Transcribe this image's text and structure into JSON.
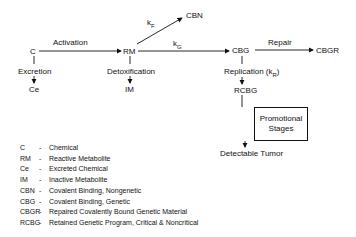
{
  "nodes": {
    "c": "C",
    "rm": "RM",
    "ce": "Ce",
    "im": "IM",
    "cbn": "CBN",
    "cbg": "CBG",
    "cbgr": "CBGR",
    "rcbg": "RCBG",
    "tumor": "Detectable Tumor",
    "promo_line1": "Promotional",
    "promo_line2": "Stages"
  },
  "edges": {
    "activation": "Activation",
    "excretion": "Excretion",
    "detoxification": "Detoxification",
    "repair": "Repair",
    "replication": "Replication (k",
    "replication_sub": "R",
    "replication_end": ")",
    "kf": "k",
    "kf_sub": "F",
    "kg": "k",
    "kg_sub": "G"
  },
  "legend": [
    {
      "abbr": "C",
      "desc": "Chemical"
    },
    {
      "abbr": "RM",
      "desc": "Reactive Metabolite"
    },
    {
      "abbr": "Ce",
      "desc": "Excreted Chemical"
    },
    {
      "abbr": "IM",
      "desc": "Inactive Metabolite"
    },
    {
      "abbr": "CBN",
      "desc": "Covalent Binding, Nongenetic"
    },
    {
      "abbr": "CBG",
      "desc": "Covalent Binding, Genetic"
    },
    {
      "abbr": "CBGR",
      "desc": "Repaired Covalently Bound Genetic Material"
    },
    {
      "abbr": "RCBG",
      "desc": "Retained Genetic Program, Critical & Noncritical"
    }
  ],
  "legend_sep": "-"
}
